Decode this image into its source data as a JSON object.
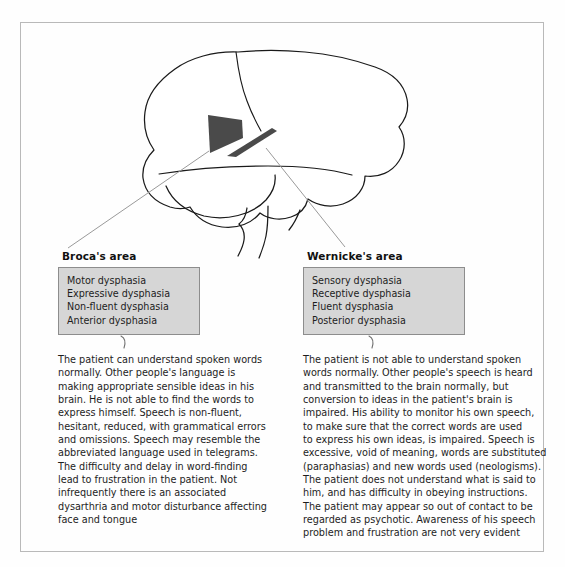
{
  "figure": {
    "caption_none": "",
    "colors": {
      "region_fill": "#4a4a4a",
      "box_fill": "#d6d6d6",
      "box_border": "#8d8d8d",
      "outline": "#1a1a1a",
      "leader_line": "#9a9a9a",
      "page_border": "#b9b9b9"
    }
  },
  "diagram": {
    "name": "lateral-brain-language-areas",
    "regions": [
      {
        "id": "brocas-region",
        "label": "Broca's area",
        "shape": "quadrilateral-patch"
      },
      {
        "id": "wernickes-region",
        "label": "Wernicke's area",
        "shape": "elongated-band"
      }
    ],
    "outline_parts": [
      "cerebrum",
      "frontal-lobe-fissure",
      "temporal-lobe",
      "cerebellum",
      "brainstem"
    ]
  },
  "broca": {
    "title": "Broca's area",
    "terms": [
      "Motor dysphasia",
      "Expressive dysphasia",
      "Non-fluent dysphasia",
      "Anterior dysphasia"
    ],
    "description_lines": [
      "The patient can understand spoken words",
      "normally. Other people's language is",
      "making appropriate sensible ideas in his",
      "brain. He is not able to find the words to",
      "express himself. Speech is non-fluent,",
      "hesitant, reduced, with grammatical errors",
      "and omissions. Speech may resemble the",
      "abbreviated language used in telegrams.",
      "The difficulty and delay in word-finding",
      "lead to frustration in the patient. Not",
      "infrequently there is an associated",
      "dysarthria and motor disturbance affecting",
      "face and tongue"
    ]
  },
  "wernicke": {
    "title": "Wernicke's area",
    "terms": [
      "Sensory dysphasia",
      "Receptive dysphasia",
      "Fluent dysphasia",
      "Posterior dysphasia"
    ],
    "description_lines": [
      "The patient is not able to understand spoken",
      "words normally. Other people's speech is heard",
      "and transmitted to the brain normally, but",
      "conversion to ideas in the patient's brain is",
      "impaired. His ability to monitor his own speech,",
      "to make sure that the correct words are used",
      "to express his own ideas, is impaired. Speech is",
      "excessive, void of meaning, words are substituted",
      "(paraphasias) and new words used (neologisms).",
      "The patient does not understand what is said to",
      "him, and has difficulty in obeying instructions.",
      "The patient may appear so out of contact to be",
      "regarded as psychotic. Awareness of his speech",
      "problem and frustration are not very evident"
    ]
  }
}
